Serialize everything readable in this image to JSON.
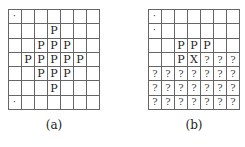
{
  "figures": [
    {
      "id": "a",
      "caption": "(a)",
      "rows": 7,
      "cols": 7,
      "cells": [
        [
          ".",
          "",
          "",
          "",
          "",
          "",
          ""
        ],
        [
          "",
          "",
          "",
          "P",
          "",
          "",
          ""
        ],
        [
          "",
          "",
          "P",
          "P",
          "P",
          "",
          ""
        ],
        [
          "",
          "P",
          "P",
          "P",
          "P",
          "P",
          ""
        ],
        [
          "",
          "",
          "P",
          "P",
          "P",
          "",
          ""
        ],
        [
          "",
          "",
          "",
          "P",
          "",
          "",
          ""
        ],
        [
          ".",
          "",
          "",
          "",
          "",
          "",
          ""
        ]
      ]
    },
    {
      "id": "b",
      "caption": "(b)",
      "rows": 7,
      "cols": 7,
      "cells": [
        [
          ".",
          "",
          "",
          "",
          "",
          "",
          ""
        ],
        [
          ".",
          "",
          "",
          "",
          "",
          "",
          ""
        ],
        [
          "",
          "",
          "P",
          "P",
          "P",
          "",
          ""
        ],
        [
          "",
          "",
          "P",
          "X",
          "?",
          "?",
          "?"
        ],
        [
          "?",
          "?",
          "?",
          "?",
          "?",
          "?",
          "?"
        ],
        [
          "?",
          "?",
          "?",
          "?",
          "?",
          "?",
          "?"
        ],
        [
          "?",
          "?",
          "?",
          "?",
          "?",
          "?",
          "?"
        ]
      ]
    }
  ]
}
